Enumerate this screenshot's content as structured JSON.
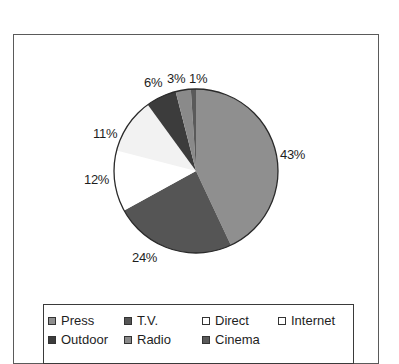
{
  "chart_data": {
    "type": "pie",
    "title": "",
    "categories": [
      "Press",
      "T.V.",
      "Direct",
      "Internet",
      "Outdoor",
      "Radio",
      "Cinema"
    ],
    "values": [
      43,
      24,
      12,
      11,
      6,
      3,
      1
    ],
    "labels": [
      "43%",
      "24%",
      "12%",
      "11%",
      "6%",
      "3%",
      "1%"
    ],
    "colors": [
      "#8f8f8f",
      "#555555",
      "#ffffff",
      "#f2f2f2",
      "#3c3c3c",
      "#8a8a8a",
      "#5a5a5a"
    ],
    "start_angle": "12 o'clock",
    "direction": "clockwise",
    "legend_position": "bottom"
  },
  "legend": {
    "items": [
      {
        "label": "Press",
        "color": "#8f8f8f"
      },
      {
        "label": "T.V.",
        "color": "#555555"
      },
      {
        "label": "Direct",
        "color": "#ffffff"
      },
      {
        "label": "Internet",
        "color": "#ffffff"
      },
      {
        "label": "Outdoor",
        "color": "#3c3c3c"
      },
      {
        "label": "Radio",
        "color": "#8a8a8a"
      },
      {
        "label": "Cinema",
        "color": "#5a5a5a"
      }
    ]
  }
}
